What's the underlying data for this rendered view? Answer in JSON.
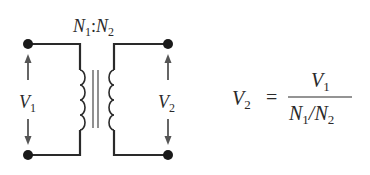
{
  "diagram": {
    "turns_ratio_label": {
      "n1": "N",
      "n1_sub": "1",
      "sep": ":",
      "n2": "N",
      "n2_sub": "2"
    },
    "primary_voltage": {
      "symbol": "V",
      "sub": "1"
    },
    "secondary_voltage": {
      "symbol": "V",
      "sub": "2"
    },
    "equation": {
      "lhs": {
        "symbol": "V",
        "sub": "2"
      },
      "equals": "=",
      "numerator": {
        "symbol": "V",
        "sub": "1"
      },
      "denominator": {
        "a": "N",
        "a_sub": "1",
        "slash": "/",
        "b": "N",
        "b_sub": "2"
      }
    },
    "colors": {
      "wire": "#2a2a2a",
      "core": "#555555",
      "arrow": "#555555",
      "text": "#2a2a2a"
    }
  }
}
